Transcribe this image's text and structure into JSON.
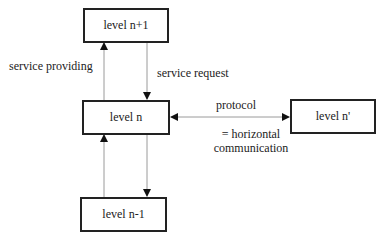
{
  "boxes": {
    "level_n_plus_1": "level n+1",
    "level_n": "level n",
    "level_n_minus_1": "level n-1",
    "level_n_prime": "level n'"
  },
  "labels": {
    "service_providing": "service providing",
    "service_request": "service request",
    "protocol": "protocol",
    "horizontal_line1": "= horizontal",
    "horizontal_line2": "communication"
  },
  "colors": {
    "box_border": "#222222",
    "connector": "#9a9a9a",
    "arrowhead": "#111111"
  }
}
